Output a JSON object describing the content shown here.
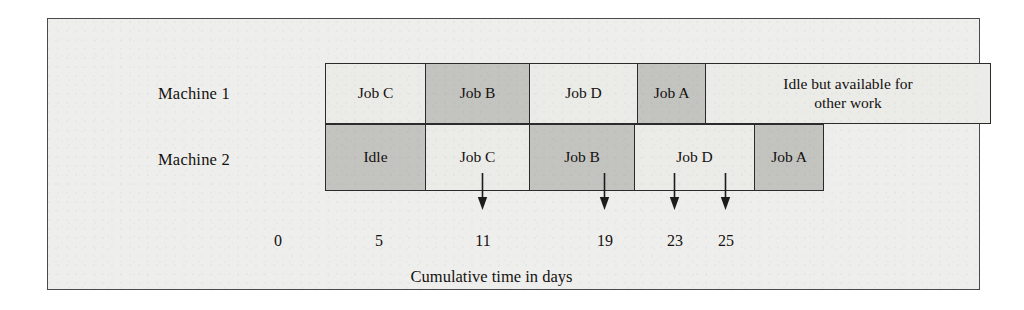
{
  "figure": {
    "row_labels": {
      "machine_1": "Machine 1",
      "machine_2": "Machine 2"
    },
    "axis_caption": "Cumulative time in days",
    "colors": {
      "panel_background": "#eeeeec",
      "panel_border": "#4a4a4a",
      "bar_border": "#2b2b2b",
      "fill_light": "#ebebe8",
      "fill_dark": "#c3c3c0",
      "text": "#14110f"
    }
  },
  "chart_data": {
    "type": "bar",
    "title": "",
    "xlabel": "Cumulative time in days",
    "ylabel": "",
    "xlim": [
      0,
      32
    ],
    "tick_values": [
      0,
      5,
      11,
      19,
      23,
      25
    ],
    "tick_labels": [
      "0",
      "5",
      "11",
      "19",
      "23",
      "25"
    ],
    "arrow_ticks": [
      11,
      19,
      23,
      25
    ],
    "grid": false,
    "legend": "none",
    "categories": [
      "Machine 1",
      "Machine 2"
    ],
    "series": [
      {
        "name": "Machine 1",
        "tasks": [
          {
            "label": "Job C",
            "start": 0,
            "end": 5,
            "duration": 5,
            "shade": "light"
          },
          {
            "label": "Job B",
            "start": 5,
            "end": 11,
            "duration": 6,
            "shade": "dark"
          },
          {
            "label": "Job D",
            "start": 11,
            "end": 17,
            "duration": 6,
            "shade": "light"
          },
          {
            "label": "Job A",
            "start": 17,
            "end": 21,
            "duration": 4,
            "shade": "dark"
          },
          {
            "label": "Idle but available for\nother work",
            "start": 21,
            "end": 32,
            "duration": 11,
            "shade": "light"
          }
        ]
      },
      {
        "name": "Machine 2",
        "tasks": [
          {
            "label": "Idle",
            "start": 0,
            "end": 5,
            "duration": 5,
            "shade": "dark"
          },
          {
            "label": "Job C",
            "start": 5,
            "end": 11,
            "duration": 6,
            "shade": "light"
          },
          {
            "label": "Job B",
            "start": 11,
            "end": 17,
            "duration": 6,
            "shade": "dark"
          },
          {
            "label": "Job D",
            "start": 17,
            "end": 23,
            "duration": 6,
            "shade": "light"
          },
          {
            "label": "Job A",
            "start": 23,
            "end": 25,
            "duration": 2,
            "shade": "dark"
          }
        ]
      }
    ]
  },
  "layout": {
    "machine_1_bars": [
      {
        "left": 0,
        "width": 101
      },
      {
        "left": 100,
        "width": 105
      },
      {
        "left": 204,
        "width": 109
      },
      {
        "left": 312,
        "width": 69
      },
      {
        "left": 380,
        "width": 286
      }
    ],
    "machine_2_bars": [
      {
        "left": 0,
        "width": 101
      },
      {
        "left": 100,
        "width": 105
      },
      {
        "left": 204,
        "width": 106
      },
      {
        "left": 309,
        "width": 121
      },
      {
        "left": 429,
        "width": 70
      }
    ],
    "tick_positions_px": [
      277,
      378,
      482,
      604,
      674,
      725
    ],
    "arrow_positions_px": [
      481,
      603,
      673,
      724
    ]
  }
}
